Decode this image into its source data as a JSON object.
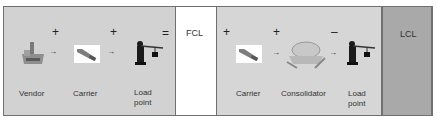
{
  "fcl_flow": {
    "steps": [
      {
        "label": "Vendor",
        "icon": "factory-icon"
      },
      {
        "label": "Carrier",
        "icon": "truck-icon"
      },
      {
        "label_line1": "Load",
        "label_line2": "point",
        "icon": "crane-icon"
      }
    ],
    "operators": [
      "+",
      "+",
      "="
    ],
    "result": "FCL"
  },
  "lcl_flow": {
    "steps": [
      {
        "label": "Carrier",
        "icon": "truck-icon"
      },
      {
        "label": "Consolidator",
        "icon": "warehouse-icon"
      },
      {
        "label_line1": "Load",
        "label_line2": "point",
        "icon": "crane-icon"
      }
    ],
    "operators": [
      "+",
      "+",
      "–"
    ],
    "result": "LCL"
  },
  "arrow": "→",
  "colors": {
    "panel_light": "#d2d2d2",
    "panel_dark": "#a9a9a9",
    "border": "#6f6f6f"
  }
}
